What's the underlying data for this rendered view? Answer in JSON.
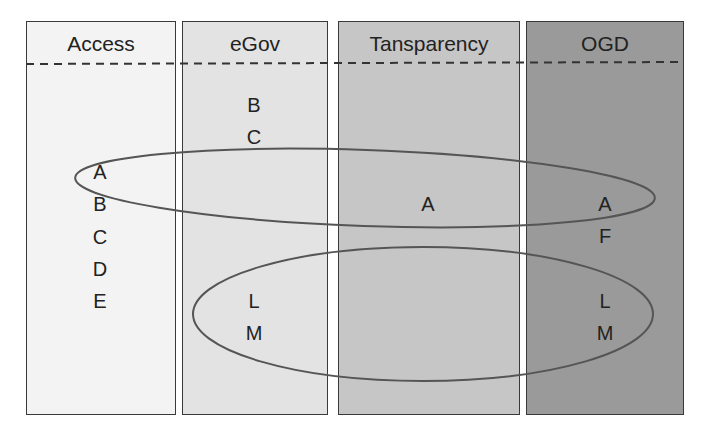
{
  "columns": [
    {
      "id": "access",
      "title": "Access",
      "color": "#f3f3f3",
      "left": 26,
      "width": 150
    },
    {
      "id": "egov",
      "title": "eGov",
      "color": "#e3e3e3",
      "left": 182,
      "width": 146
    },
    {
      "id": "transparency",
      "title": "Tansparency",
      "color": "#c6c6c6",
      "left": 338,
      "width": 182
    },
    {
      "id": "ogd",
      "title": "OGD",
      "color": "#9a9a9a",
      "left": 526,
      "width": 158
    }
  ],
  "items": {
    "access": [
      "A",
      "B",
      "C",
      "D",
      "E"
    ],
    "egov": [
      "B",
      "C",
      "L",
      "M"
    ],
    "transparency": [
      "A"
    ],
    "ogd": [
      "A",
      "F",
      "L",
      "M"
    ]
  },
  "labels": {
    "access_A": "A",
    "access_B": "B",
    "access_C": "C",
    "access_D": "D",
    "access_E": "E",
    "egov_B": "B",
    "egov_C": "C",
    "egov_L": "L",
    "egov_M": "M",
    "transparency_A": "A",
    "ogd_A": "A",
    "ogd_F": "F",
    "ogd_L": "L",
    "ogd_M": "M"
  },
  "groups": [
    {
      "name": "A-group",
      "members": [
        "Access:A",
        "Tansparency:A",
        "OGD:A"
      ]
    },
    {
      "name": "LM-group",
      "members": [
        "eGov:L",
        "eGov:M",
        "OGD:L",
        "OGD:M"
      ]
    }
  ]
}
